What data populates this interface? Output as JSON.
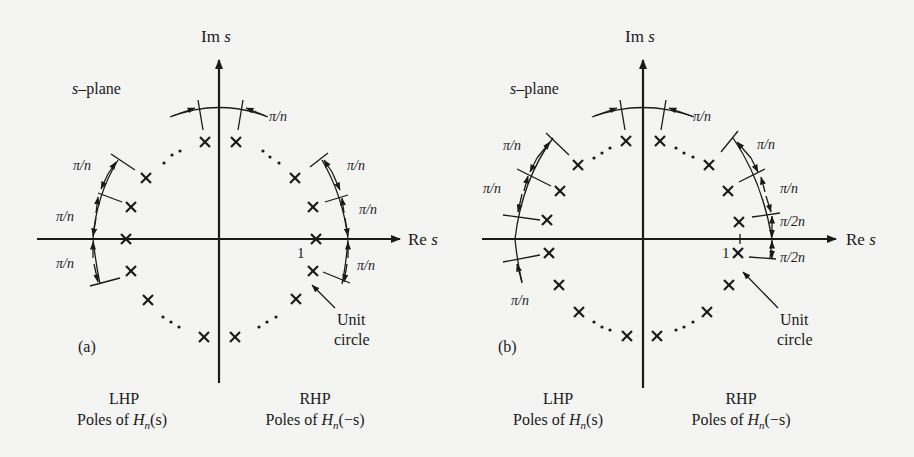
{
  "figure": {
    "panels": [
      {
        "id": "a",
        "label": "(a)",
        "plane_label": "s–plane",
        "plane_label_s": "s",
        "plane_label_rest": "–plane",
        "im_axis_label": "Im",
        "re_axis_label": "Re",
        "axis_var": "s",
        "unit_marker": "1",
        "unit_circle_label_1": "Unit",
        "unit_circle_label_2": "circle",
        "angle_labels": [
          "π/n",
          "π/n",
          "π/n",
          "π/n",
          "π/n",
          "π/n",
          "π/n"
        ],
        "lhp_title": "LHP",
        "lhp_caption_prefix": "Poles of ",
        "lhp_caption_func": "H",
        "lhp_caption_sub": "n",
        "lhp_caption_arg": "(s)",
        "rhp_title": "RHP",
        "rhp_caption_prefix": "Poles of ",
        "rhp_caption_func": "H",
        "rhp_caption_sub": "n",
        "rhp_caption_arg": "(−s)",
        "pole_case": "n odd (pole on real axis)"
      },
      {
        "id": "b",
        "label": "(b)",
        "plane_label": "s–plane",
        "plane_label_s": "s",
        "plane_label_rest": "–plane",
        "im_axis_label": "Im",
        "re_axis_label": "Re",
        "axis_var": "s",
        "unit_marker": "1",
        "unit_circle_label_1": "Unit",
        "unit_circle_label_2": "circle",
        "angle_labels": [
          "π/n",
          "π/n",
          "π/n",
          "π/n",
          "π/n",
          "π/2n",
          "π/2n",
          "π/n"
        ],
        "lhp_title": "LHP",
        "lhp_caption_prefix": "Poles of ",
        "lhp_caption_func": "H",
        "lhp_caption_sub": "n",
        "lhp_caption_arg": "(s)",
        "rhp_title": "RHP",
        "rhp_caption_prefix": "Poles of ",
        "rhp_caption_func": "H",
        "rhp_caption_sub": "n",
        "rhp_caption_arg": "(−s)",
        "pole_case": "n even (poles offset by π/2n)"
      }
    ],
    "pole_marker": "×",
    "ellipsis": "· · ·",
    "colors": {
      "ink": "#1a1a1a",
      "paper": "#f4f4f2"
    }
  }
}
